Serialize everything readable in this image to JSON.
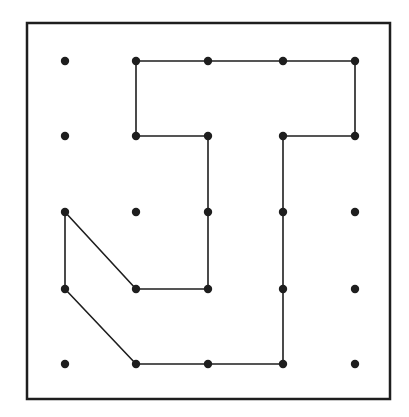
{
  "figure": {
    "type": "geoboard",
    "grid_size": [
      5,
      5
    ],
    "colors": {
      "background": "#ffffff",
      "ink": "#1e1e1e"
    },
    "frame": {
      "x": 27,
      "y": 23,
      "width": 363,
      "height": 376,
      "stroke_width": 2.5
    },
    "grid": {
      "x_positions": [
        65,
        136,
        208,
        283,
        355
      ],
      "y_positions": [
        61,
        136,
        212,
        289,
        364
      ],
      "dot_radius": 4.2
    },
    "polygon": {
      "description": "closed rubber-band shape joining pegs (col,row), 0-indexed from top-left",
      "vertices": [
        [
          1,
          0
        ],
        [
          2,
          0
        ],
        [
          3,
          0
        ],
        [
          4,
          0
        ],
        [
          4,
          1
        ],
        [
          3,
          1
        ],
        [
          3,
          2
        ],
        [
          3,
          3
        ],
        [
          3,
          4
        ],
        [
          2,
          4
        ],
        [
          1,
          4
        ],
        [
          0,
          3
        ],
        [
          0,
          2
        ],
        [
          1,
          3
        ],
        [
          2,
          3
        ],
        [
          2,
          2
        ],
        [
          2,
          1
        ],
        [
          1,
          1
        ]
      ],
      "stroke_width": 1.6
    }
  }
}
